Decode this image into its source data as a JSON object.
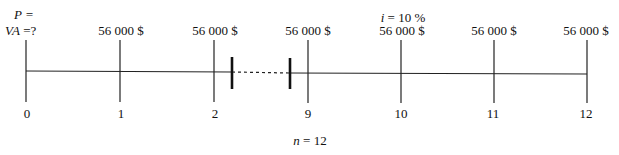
{
  "diagram": {
    "type": "cash-flow timeline",
    "present_value": {
      "line1": "P =",
      "line2_var": "VA",
      "line2_rest": " =?"
    },
    "interest": {
      "var": "i",
      "rest": " = 10 %"
    },
    "periods": {
      "var": "n",
      "rest": " = 12"
    },
    "ticks": [
      {
        "label": "0",
        "x": 26,
        "amount": ""
      },
      {
        "label": "1",
        "x": 120,
        "amount": "56 000 $"
      },
      {
        "label": "2",
        "x": 214,
        "amount": "56 000 $"
      },
      {
        "label": "9",
        "x": 308,
        "amount": "56 000 $"
      },
      {
        "label": "10",
        "x": 401,
        "amount": "56 000 $"
      },
      {
        "label": "11",
        "x": 494,
        "amount": "56 000 $"
      },
      {
        "label": "12",
        "x": 587,
        "amount": "56 000 $"
      }
    ],
    "break_markers": [
      232,
      290
    ],
    "colors": {
      "line": "#222222",
      "background": "#ffffff"
    }
  }
}
